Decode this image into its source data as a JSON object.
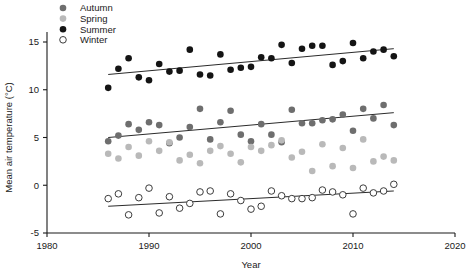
{
  "chart_data": {
    "type": "scatter",
    "title": "",
    "xlabel": "Year",
    "ylabel": "Mean air temperature (°C)",
    "xlim": [
      1980,
      2020
    ],
    "ylim": [
      -5,
      15
    ],
    "xticks": [
      1980,
      1990,
      2000,
      2010,
      2020
    ],
    "xticklabels": [
      "1980",
      "1990",
      "2000",
      "2010",
      "2020"
    ],
    "yticks": [
      -5,
      0,
      5,
      10,
      15
    ],
    "yticklabels": [
      "-5",
      "0",
      "5",
      "10",
      "15"
    ],
    "grid": false,
    "legend_position": "top-left",
    "series": [
      {
        "name": "Autumn",
        "marker": "filled-circle",
        "color": "#6e6e6e",
        "x": [
          1986,
          1987,
          1988,
          1989,
          1990,
          1991,
          1992,
          1993,
          1994,
          1995,
          1996,
          1997,
          1998,
          1999,
          2000,
          2001,
          2002,
          2003,
          2004,
          2005,
          2006,
          2007,
          2008,
          2009,
          2010,
          2011,
          2012,
          2013,
          2014
        ],
        "y": [
          4.6,
          5.2,
          6.4,
          5.8,
          6.6,
          6.3,
          4.4,
          5.0,
          6.1,
          8.0,
          4.8,
          6.6,
          7.8,
          5.3,
          4.6,
          6.4,
          5.3,
          4.5,
          7.9,
          6.5,
          6.5,
          6.8,
          6.9,
          7.4,
          5.7,
          8.0,
          7.0,
          8.4,
          6.3
        ],
        "trendline": {
          "x": [
            1986,
            2014
          ],
          "y": [
            5.0,
            7.6
          ]
        }
      },
      {
        "name": "Spring",
        "marker": "filled-circle",
        "color": "#b9b9b9",
        "x": [
          1986,
          1987,
          1988,
          1989,
          1990,
          1991,
          1992,
          1993,
          1994,
          1995,
          1996,
          1997,
          1998,
          1999,
          2000,
          2001,
          2002,
          2003,
          2004,
          2005,
          2006,
          2007,
          2008,
          2009,
          2010,
          2011,
          2012,
          2013,
          2014
        ],
        "y": [
          3.3,
          2.8,
          4.0,
          3.1,
          4.6,
          3.6,
          4.5,
          2.6,
          3.2,
          2.3,
          3.6,
          4.1,
          3.3,
          2.4,
          4.0,
          3.6,
          4.2,
          4.7,
          2.9,
          3.5,
          1.5,
          4.3,
          2.0,
          3.9,
          1.8,
          4.8,
          2.5,
          3.0,
          2.6
        ],
        "trendline": null
      },
      {
        "name": "Summer",
        "marker": "filled-circle",
        "color": "#141414",
        "x": [
          1986,
          1987,
          1988,
          1989,
          1990,
          1991,
          1992,
          1993,
          1994,
          1995,
          1996,
          1997,
          1998,
          1999,
          2000,
          2001,
          2002,
          2003,
          2004,
          2005,
          2006,
          2007,
          2008,
          2009,
          2010,
          2011,
          2012,
          2013,
          2014
        ],
        "y": [
          10.2,
          12.2,
          13.3,
          11.3,
          11.0,
          12.7,
          11.9,
          12.0,
          14.2,
          11.6,
          11.5,
          13.7,
          12.1,
          12.3,
          12.4,
          13.4,
          13.3,
          14.7,
          12.8,
          14.3,
          14.6,
          14.6,
          12.6,
          13.0,
          14.9,
          13.3,
          14.0,
          14.2,
          13.5
        ],
        "trendline": {
          "x": [
            1986,
            2014
          ],
          "y": [
            11.6,
            14.3
          ]
        }
      },
      {
        "name": "Winter",
        "marker": "open-circle",
        "color": "#3c3c3c",
        "x": [
          1986,
          1987,
          1988,
          1989,
          1990,
          1991,
          1992,
          1993,
          1994,
          1995,
          1996,
          1997,
          1998,
          1999,
          2000,
          2001,
          2002,
          2003,
          2004,
          2005,
          2006,
          2007,
          2008,
          2009,
          2010,
          2011,
          2012,
          2013,
          2014
        ],
        "y": [
          -1.4,
          -0.9,
          -3.1,
          -1.3,
          -0.3,
          -2.9,
          -1.2,
          -2.4,
          -1.9,
          -0.7,
          -0.6,
          -3.0,
          -0.9,
          -1.6,
          -2.5,
          -2.2,
          -0.6,
          -1.1,
          -1.4,
          -1.4,
          -1.3,
          -0.5,
          -0.7,
          -1.0,
          -3.0,
          -0.3,
          -0.8,
          -0.6,
          0.1
        ],
        "trendline": {
          "x": [
            1986,
            2014
          ],
          "y": [
            -2.2,
            -0.6
          ]
        }
      }
    ]
  },
  "legend": {
    "items": [
      {
        "label": "Autumn"
      },
      {
        "label": "Spring"
      },
      {
        "label": "Summer"
      },
      {
        "label": "Winter"
      }
    ]
  },
  "axes": {
    "x_title": "Year",
    "y_title": "Mean air temperature (°C)"
  },
  "style": {
    "axis_color": "#1a1a1a",
    "trendline_color": "#2b2b2b",
    "background": "#ffffff"
  }
}
